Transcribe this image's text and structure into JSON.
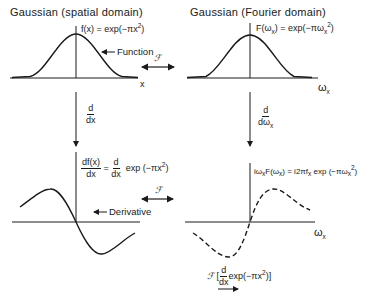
{
  "titles": {
    "spatial": "Gaussian (spatial domain)",
    "fourier": "Gaussian (Fourier domain)"
  },
  "equations": {
    "spatial_function": "f(x) = exp(−πx²)",
    "spatial_function_lhs": "f(x) = exp(−πx",
    "fourier_function_lhs": "F(ω",
    "fourier_function_mid": ") = exp(−πω",
    "derivative_num": "df(x)",
    "derivative_den": "dx",
    "derivative_eq": "=",
    "derivative_op_num": "d",
    "derivative_op_den": "dx",
    "derivative_rhs": "exp (−πx",
    "fourier_derivative_a": "iω",
    "fourier_derivative_b": "F(ω",
    "fourier_derivative_c": ") = i2πf",
    "fourier_derivative_d": " exp (−πω",
    "transform_symbol": "ℱ",
    "transform_open": "[",
    "transform_num": "d",
    "transform_den": "dx",
    "transform_body": "exp(−πx",
    "transform_close": ")]"
  },
  "operators": {
    "left_num": "d",
    "left_den": "dx",
    "right_num": "d",
    "right_den": "dω",
    "x_sub": "x"
  },
  "annotations": {
    "function": "Function",
    "derivative": "Derivative",
    "fourier_symbol": "ℱ"
  },
  "axes": {
    "x": "x",
    "omega": "ω",
    "omega_sub": "x",
    "sup2": "2"
  },
  "colors": {
    "ink": "#1a1a1a",
    "background": "#ffffff"
  }
}
